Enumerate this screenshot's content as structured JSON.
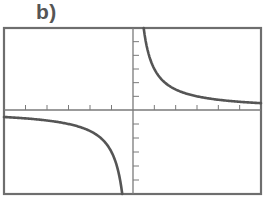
{
  "panel_label": "b)",
  "colors": {
    "frame": "#6e6e6e",
    "curve": "#555555",
    "axis": "#7a7a7a"
  },
  "chart_data": {
    "type": "line",
    "title": "b)",
    "xlabel": "",
    "ylabel": "",
    "function": "y = k/x (rectangular hyperbola, k>0)",
    "xlim": [
      -6,
      6
    ],
    "ylim": [
      -6,
      6
    ],
    "x_ticks_per_side": 6,
    "y_ticks_per_side": 6,
    "grid": false,
    "legend": null,
    "series": [
      {
        "name": "branch-negative-x",
        "x": [
          -6,
          -5,
          -4,
          -3,
          -2,
          -1.5,
          -1,
          -0.7,
          -0.5
        ],
        "y": [
          -0.5,
          -0.6,
          -0.75,
          -1,
          -1.5,
          -2,
          -3,
          -4.3,
          -6
        ]
      },
      {
        "name": "branch-positive-x",
        "x": [
          0.5,
          0.7,
          1,
          1.5,
          2,
          3,
          4,
          5,
          6
        ],
        "y": [
          6,
          4.3,
          3,
          2,
          1.5,
          1,
          0.75,
          0.6,
          0.5
        ]
      }
    ]
  }
}
